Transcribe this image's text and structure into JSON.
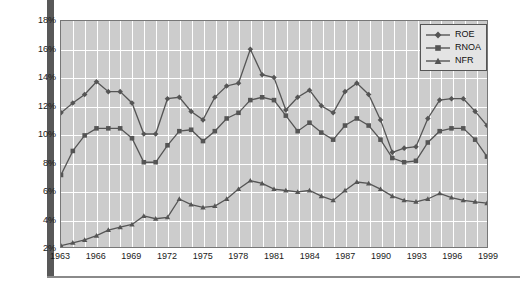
{
  "chart_data": {
    "type": "line",
    "title": "",
    "xlabel": "",
    "ylabel": "",
    "grid": true,
    "legend_position": "top-right",
    "x": [
      1963,
      1964,
      1965,
      1966,
      1967,
      1968,
      1969,
      1970,
      1971,
      1972,
      1973,
      1974,
      1975,
      1976,
      1977,
      1978,
      1979,
      1980,
      1981,
      1982,
      1983,
      1984,
      1985,
      1986,
      1987,
      1988,
      1989,
      1990,
      1991,
      1992,
      1993,
      1994,
      1995,
      1996,
      1997,
      1998,
      1999
    ],
    "xlim": [
      1963,
      1999
    ],
    "ylim": [
      2,
      18
    ],
    "y_tick_labels": [
      "18%",
      "16%",
      "14%",
      "12%",
      "10%",
      "8%",
      "6%",
      "4%",
      "2%"
    ],
    "y_tick_values": [
      18,
      16,
      14,
      12,
      10,
      8,
      6,
      4,
      2
    ],
    "x_tick_labels": [
      "1963",
      "1966",
      "1969",
      "1972",
      "1975",
      "1978",
      "1981",
      "1984",
      "1987",
      "1990",
      "1993",
      "1996",
      "1999"
    ],
    "x_tick_values": [
      1963,
      1966,
      1969,
      1972,
      1975,
      1978,
      1981,
      1984,
      1987,
      1990,
      1993,
      1996,
      1999
    ],
    "series": [
      {
        "name": "ROE",
        "marker": "diamond",
        "color": "#555555",
        "values": [
          11.5,
          12.2,
          12.8,
          13.7,
          13.0,
          13.0,
          12.2,
          10.0,
          10.0,
          12.5,
          12.6,
          11.6,
          11.0,
          12.6,
          13.4,
          13.6,
          16.0,
          14.2,
          14.0,
          11.7,
          12.6,
          13.1,
          12.0,
          11.5,
          13.0,
          13.6,
          12.8,
          11.0,
          8.7,
          9.0,
          9.1,
          11.1,
          12.4,
          12.5,
          12.5,
          11.6,
          10.6
        ]
      },
      {
        "name": "RNOA",
        "marker": "square",
        "color": "#555555",
        "values": [
          7.1,
          8.8,
          9.9,
          10.4,
          10.4,
          10.4,
          9.7,
          8.0,
          8.0,
          9.2,
          10.2,
          10.3,
          9.5,
          10.2,
          11.1,
          11.5,
          12.4,
          12.6,
          12.4,
          11.3,
          10.2,
          10.8,
          10.1,
          9.6,
          10.6,
          11.1,
          10.6,
          9.6,
          8.3,
          8.0,
          8.1,
          9.4,
          10.2,
          10.4,
          10.4,
          9.6,
          8.4
        ]
      },
      {
        "name": "NFR",
        "marker": "triangle",
        "color": "#555555",
        "values": [
          2.1,
          2.3,
          2.5,
          2.8,
          3.2,
          3.4,
          3.6,
          4.2,
          4.0,
          4.1,
          5.4,
          5.0,
          4.8,
          4.9,
          5.4,
          6.1,
          6.7,
          6.5,
          6.1,
          6.0,
          5.9,
          6.0,
          5.6,
          5.3,
          6.0,
          6.6,
          6.5,
          6.1,
          5.6,
          5.3,
          5.2,
          5.4,
          5.8,
          5.5,
          5.3,
          5.2,
          5.1
        ]
      }
    ]
  },
  "legend": {
    "items": [
      {
        "label": "ROE"
      },
      {
        "label": "RNOA"
      },
      {
        "label": "NFR"
      }
    ]
  },
  "colors": {
    "plot_background": "#cccccc",
    "gridline": "#ffffff",
    "series_line": "#555555",
    "frame": "#585858",
    "text": "#1a1a1a"
  }
}
